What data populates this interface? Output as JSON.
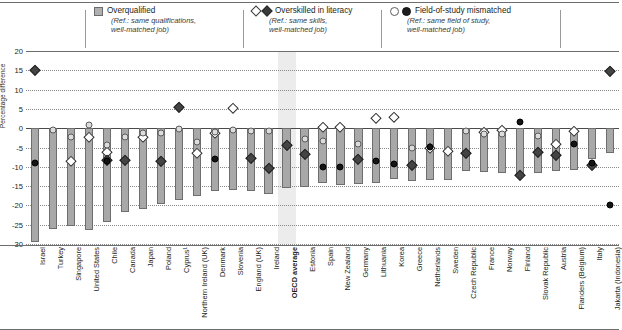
{
  "chart_data": {
    "type": "bar",
    "title": "",
    "xlabel": "",
    "ylabel": "Percentage difference",
    "ylim": [
      -30,
      20
    ],
    "yticks": [
      20,
      15,
      10,
      5,
      0,
      -5,
      -10,
      -15,
      -20,
      -25,
      -30
    ],
    "grid": true,
    "legend_position": "top",
    "highlight_category": "OECD average",
    "categories": [
      "Israel",
      "Turkey",
      "Singapore",
      "United States",
      "Chile",
      "Canada",
      "Japan",
      "Poland",
      "Cyprus¹",
      "Northern Ireland (UK)",
      "Denmark",
      "Slovenia",
      "England (UK)",
      "Ireland",
      "OECD average",
      "Estonia",
      "Spain",
      "New Zealand",
      "Germany",
      "Lithuania",
      "Korea",
      "Greece",
      "Netherlands",
      "Sweden",
      "Czech Republic",
      "France",
      "Norway",
      "Finland",
      "Slovak Republic",
      "Austria",
      "Flanders (Belgium)",
      "Italy",
      "Jakarta (Indonesia)"
    ],
    "series": [
      {
        "name": "Overqualified",
        "ref": "Ref.: same qualifications, well-matched job",
        "marker": "square",
        "render": "bar",
        "values": [
          -29.6,
          -26.2,
          -25.4,
          -26.3,
          -24.3,
          -21.8,
          -21.0,
          -19.6,
          -18.7,
          -17.5,
          -16.3,
          -16.0,
          -16.2,
          -17.0,
          -15.4,
          -15.3,
          -14.2,
          -14.6,
          -14.5,
          -14.3,
          -13.1,
          -13.7,
          -13.4,
          -13.4,
          -11.0,
          -11.3,
          -11.5,
          -12.0,
          -11.6,
          -11.0,
          -10.8,
          -7.9,
          -6.4
        ]
      },
      {
        "name": "Overskilled in literacy",
        "ref": "Ref.: same skills, well-matched job",
        "marker": "diamond-open",
        "render": "point",
        "values": [
          null,
          null,
          -8.6,
          -2.3,
          -6.2,
          null,
          -2.2,
          null,
          null,
          -6.3,
          -1.2,
          5.3,
          null,
          null,
          null,
          null,
          0.4,
          0.3,
          null,
          2.6,
          2.8,
          null,
          -5.0,
          -6.0,
          null,
          -0.9,
          -0.5,
          null,
          null,
          -4.0,
          -0.8,
          null,
          null
        ]
      },
      {
        "name": "Overskilled in literacy (filled)",
        "ref": "Ref.: same skills, well-matched job",
        "marker": "diamond-filled",
        "render": "point",
        "values": [
          15.2,
          null,
          null,
          null,
          -8.3,
          -8.3,
          null,
          -8.5,
          5.4,
          null,
          null,
          null,
          -7.8,
          -10.2,
          -4.3,
          -6.8,
          null,
          null,
          -8.1,
          null,
          null,
          -9.5,
          null,
          null,
          -6.3,
          null,
          null,
          -12.0,
          -6.1,
          -6.9,
          null,
          -9.6,
          14.8
        ]
      },
      {
        "name": "Field-of-study mismatched",
        "ref": "Ref.: same field of study, well-matched job",
        "marker": "circle-open",
        "render": "point",
        "values": [
          null,
          -0.5,
          -2.3,
          0.9,
          -4.4,
          -2.4,
          -1.2,
          -1.3,
          -0.2,
          -3.5,
          -1.1,
          -0.4,
          -0.8,
          -0.7,
          null,
          -2.9,
          -3.3,
          null,
          -4.2,
          null,
          null,
          -5.1,
          null,
          null,
          -0.6,
          -1.4,
          -1.5,
          null,
          -2.0,
          null,
          null,
          null,
          null
        ]
      },
      {
        "name": "Field-of-study mismatched (filled)",
        "ref": "Ref.: same field of study, well-matched job",
        "marker": "circle-filled",
        "render": "point",
        "values": [
          -8.9,
          null,
          null,
          null,
          -8.5,
          null,
          null,
          null,
          null,
          null,
          -8.1,
          null,
          null,
          null,
          null,
          null,
          -10.1,
          -10.0,
          null,
          -8.6,
          -9.4,
          null,
          -4.8,
          null,
          null,
          null,
          null,
          1.6,
          null,
          null,
          -4.2,
          -9.0,
          -20.0
        ]
      }
    ]
  },
  "legend": {
    "items": [
      {
        "label": "Overqualified",
        "ref_line1": "(Ref.: same qualifications,",
        "ref_line2": "well-matched job)",
        "marks": [
          "square"
        ]
      },
      {
        "label": "Overskilled in literacy",
        "ref_line1": "(Ref.: same skills,",
        "ref_line2": "well-matched job)",
        "marks": [
          "diamond-open",
          "diamond-filled"
        ]
      },
      {
        "label": "Field-of-study mismatched",
        "ref_line1": "(Ref.: same field of study,",
        "ref_line2": "well-matched job)",
        "marks": [
          "circle-open",
          "circle-filled"
        ]
      }
    ]
  },
  "axis": {
    "y_title": "Percentage difference"
  },
  "colors": {
    "bar_fill": "#a8a8a8",
    "bar_stroke": "#6e6e6e",
    "highlight_band": "#ececec",
    "grid": "#8a8a8a",
    "text": "#231f20"
  }
}
